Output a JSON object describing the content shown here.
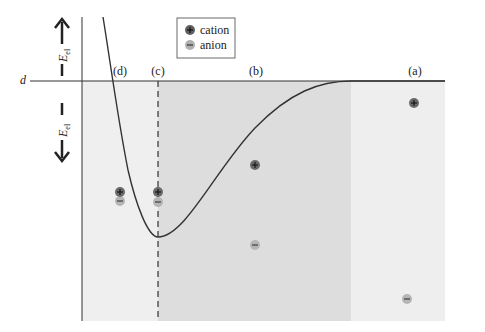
{
  "diagram": {
    "type": "potential-energy-curve",
    "y_axis": {
      "up_label": "E",
      "up_subscript": "el",
      "down_label": "E",
      "down_subscript": "el",
      "baseline_label": "d"
    },
    "regions": [
      {
        "id": "d",
        "label": "(d)",
        "x_label": 120
      },
      {
        "id": "c",
        "label": "(c)",
        "x_label": 158
      },
      {
        "id": "b",
        "label": "(b)",
        "x_label": 256
      },
      {
        "id": "a",
        "label": "(a)",
        "x_label": 415
      }
    ],
    "legend": {
      "items": [
        {
          "symbol": "+",
          "label": "cation"
        },
        {
          "symbol": "−",
          "label": "anion"
        }
      ]
    },
    "ions": [
      {
        "type": "cation",
        "symbol": "+",
        "x": 414,
        "y": 103,
        "region": "a"
      },
      {
        "type": "anion",
        "symbol": "−",
        "x": 407,
        "y": 299,
        "region": "a"
      },
      {
        "type": "cation",
        "symbol": "+",
        "x": 255,
        "y": 165,
        "region": "b"
      },
      {
        "type": "anion",
        "symbol": "−",
        "x": 255,
        "y": 245,
        "region": "b"
      },
      {
        "type": "cation",
        "symbol": "+",
        "x": 158,
        "y": 192,
        "region": "c"
      },
      {
        "type": "anion",
        "symbol": "−",
        "x": 158,
        "y": 202,
        "region": "c"
      },
      {
        "type": "cation",
        "symbol": "+",
        "x": 120,
        "y": 192,
        "region": "d"
      },
      {
        "type": "anion",
        "symbol": "−",
        "x": 120,
        "y": 201,
        "region": "d"
      }
    ],
    "colors": {
      "region_light": "#eeeeee",
      "region_dark": "#dcdcdc",
      "region_a": "#ededed",
      "curve": "#333333",
      "cation_fill": "#6a6a6a",
      "anion_fill": "#b5b5b5"
    }
  }
}
